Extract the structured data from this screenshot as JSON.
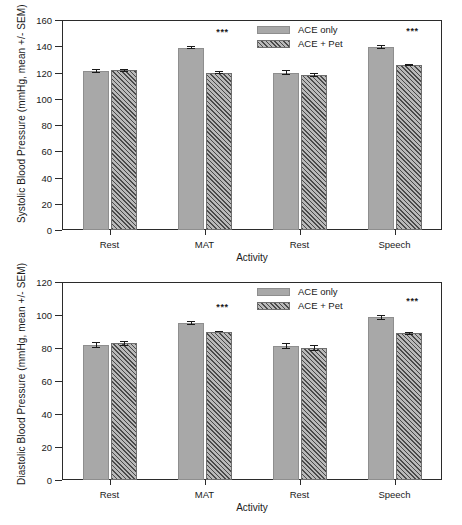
{
  "figure": {
    "legend": {
      "series": [
        "ACE only",
        "ACE + Pet"
      ],
      "position": "top-center-right"
    },
    "significance_marker": "***"
  },
  "chart_data": [
    {
      "type": "bar",
      "panel": "top",
      "title": "",
      "xlabel": "Activity",
      "ylabel": "Systolic Blood Pressure (mmHg, mean +/- SEM)",
      "categories": [
        "Rest",
        "MAT",
        "Rest",
        "Speech"
      ],
      "ylim": [
        0,
        160
      ],
      "yticks": [
        0,
        20,
        40,
        60,
        80,
        100,
        120,
        140,
        160
      ],
      "grid": false,
      "series": [
        {
          "name": "ACE only",
          "values": [
            121,
            139,
            120,
            139.5
          ],
          "errors": [
            1.6,
            1.4,
            2.0,
            1.5
          ]
        },
        {
          "name": "ACE + Pet",
          "values": [
            121.8,
            120,
            118,
            126
          ],
          "errors": [
            1.2,
            0.8,
            1.6,
            0.8
          ]
        }
      ],
      "annotations": [
        {
          "category": "MAT",
          "text": "***"
        },
        {
          "category": "Speech",
          "text": "***"
        }
      ]
    },
    {
      "type": "bar",
      "panel": "bottom",
      "title": "",
      "xlabel": "Activity",
      "ylabel": "Diastolic Blood Pressure (mmHg, mean +/- SEM)",
      "categories": [
        "Rest",
        "MAT",
        "Rest",
        "Speech"
      ],
      "ylim": [
        0,
        120
      ],
      "yticks": [
        0,
        20,
        40,
        60,
        80,
        100,
        120
      ],
      "grid": false,
      "series": [
        {
          "name": "ACE only",
          "values": [
            82,
            95,
            81,
            98.5
          ],
          "errors": [
            1.8,
            1.3,
            1.8,
            1.5
          ]
        },
        {
          "name": "ACE + Pet",
          "values": [
            83,
            90,
            80,
            89
          ],
          "errors": [
            1.5,
            0.6,
            1.6,
            1.0
          ]
        }
      ],
      "annotations": [
        {
          "category": "MAT",
          "text": "***"
        },
        {
          "category": "Speech",
          "text": "***"
        }
      ]
    }
  ]
}
